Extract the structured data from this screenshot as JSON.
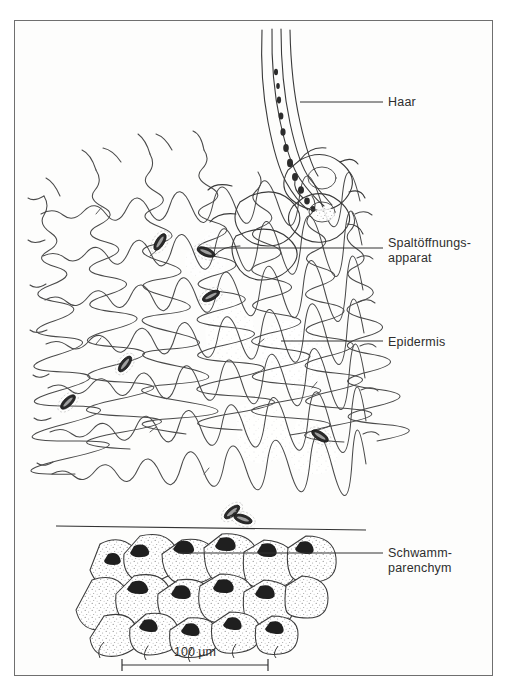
{
  "figure": {
    "kind": "scientific-line-drawing",
    "background_color": "#fdfdfc",
    "ink_color": "#2e2e2e",
    "frame_color": "#6f6f6f"
  },
  "labels": {
    "haar": "Haar",
    "spaltoeffnungsapparat": "Spaltöffnungs-\napparat",
    "epidermis": "Epidermis",
    "schwammparenchym": "Schwamm-\nparenchym"
  },
  "scale_bar": {
    "text": "100 µm",
    "value": 100,
    "unit": "µm",
    "bar_length_px": 146
  },
  "leader_lines": [
    {
      "name": "haar",
      "from_x": 300,
      "from_y": 102,
      "to_x": 383,
      "to_y": 102
    },
    {
      "name": "spaltoeffnungsapparat",
      "from_x": 205,
      "from_y": 248,
      "to_x": 383,
      "to_y": 248
    },
    {
      "name": "epidermis",
      "from_x": 281,
      "from_y": 341,
      "to_x": 383,
      "to_y": 341
    },
    {
      "name": "schwammparenchym",
      "from_x": 178,
      "from_y": 553,
      "to_x": 383,
      "to_y": 553
    }
  ],
  "structures": {
    "trichome": {
      "label_ref": "haar",
      "description": "long curved unicellular hair with granular contents"
    },
    "stomata_count": 8,
    "epidermis_cells": "wavy-walled polygonal pavement cells",
    "spongy_parenchyma": "rounded stippled cells with dark intercellular junctions"
  }
}
